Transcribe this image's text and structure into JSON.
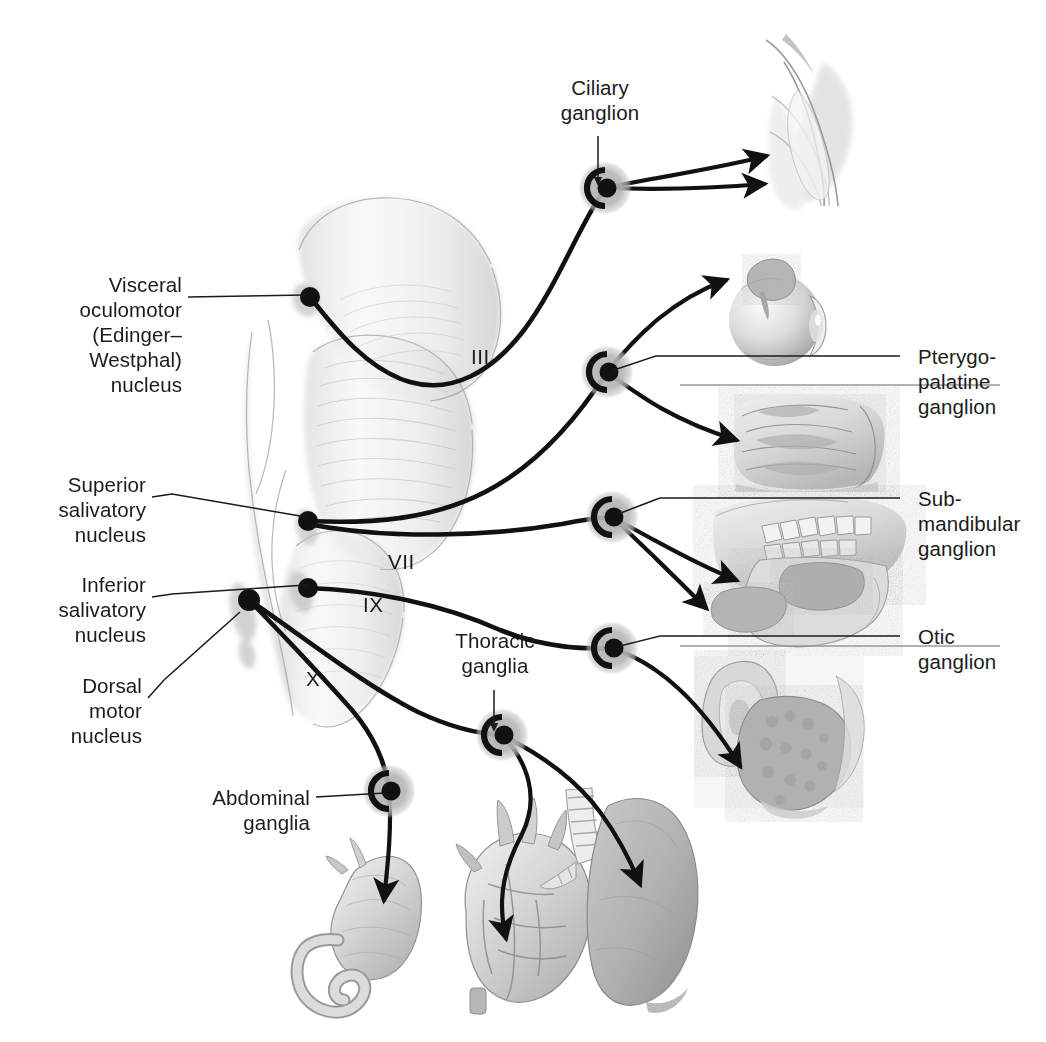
{
  "figure": {
    "background": "#ffffff",
    "ink": "#1b1b1b",
    "halo_color": "#b8b8b8",
    "wash_color": "#cfcfcf",
    "width": 1046,
    "height": 1042
  },
  "labels": {
    "visceral_oculomotor_nucleus": "Visceral\noculomotor\n(Edinger–\nWestphal)\nnucleus",
    "superior_salivatory_nucleus": "Superior\nsalivatory\nnucleus",
    "inferior_salivatory_nucleus": "Inferior\nsalivatory\nnucleus",
    "dorsal_motor_nucleus": "Dorsal\nmotor\nnucleus",
    "abdominal_ganglia": "Abdominal\nganglia",
    "thoracic_ganglia": "Thoracic\nganglia",
    "ciliary_ganglion": "Ciliary\nganglion",
    "pterygopalatine_ganglion": "Pterygo-\npalatine\nganglion",
    "submandibular_ganglion": "Sub-\nmandibular\nganglion",
    "otic_ganglion": "Otic\nganglion"
  },
  "nerve_numerals": {
    "oculomotor": "III",
    "facial": "VII",
    "glossopharyngeal": "IX",
    "vagus": "X"
  },
  "nuclei": [
    {
      "name": "visceral-oculomotor-nucleus",
      "x": 310,
      "y": 297
    },
    {
      "name": "superior-salivatory-nucleus",
      "x": 308,
      "y": 521
    },
    {
      "name": "inferior-salivatory-nucleus",
      "x": 308,
      "y": 588
    },
    {
      "name": "dorsal-motor-nucleus",
      "x": 249,
      "y": 600
    }
  ],
  "ganglia": [
    {
      "name": "ciliary-ganglion",
      "x": 605,
      "y": 188
    },
    {
      "name": "pterygopalatine-ganglion",
      "x": 607,
      "y": 372
    },
    {
      "name": "submandibular-ganglion",
      "x": 612,
      "y": 517
    },
    {
      "name": "otic-ganglion",
      "x": 612,
      "y": 648
    },
    {
      "name": "thoracic-ganglia",
      "x": 502,
      "y": 735
    },
    {
      "name": "abdominal-ganglia",
      "x": 389,
      "y": 791
    }
  ],
  "target_organs": [
    {
      "name": "eye-anterior-segment",
      "arrows": 2
    },
    {
      "name": "eyeball-lacrimal-gland",
      "arrows": 1
    },
    {
      "name": "nasal-cavity",
      "arrows": 1
    },
    {
      "name": "jaw-salivary-glands",
      "arrows": 2
    },
    {
      "name": "ear-parotid-gland",
      "arrows": 1
    },
    {
      "name": "stomach-intestine",
      "arrows": 1
    },
    {
      "name": "heart",
      "arrows": 1
    },
    {
      "name": "lung-trachea",
      "arrows": 1
    }
  ]
}
